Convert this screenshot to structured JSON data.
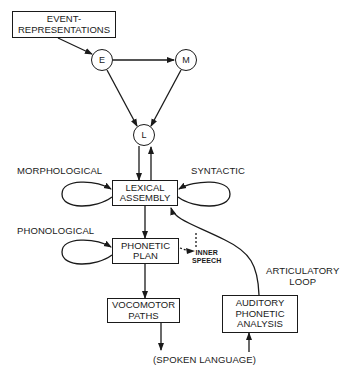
{
  "diagram": {
    "boxes": {
      "event": {
        "line1": "EVENT-",
        "line2": "REPRESENTATIONS"
      },
      "lexical": {
        "line1": "LEXICAL",
        "line2": "ASSEMBLY"
      },
      "phonetic": {
        "line1": "PHONETIC",
        "line2": "PLAN"
      },
      "vocomotor": {
        "line1": "VOCOMOTOR",
        "line2": "PATHS"
      },
      "auditory": {
        "line1": "AUDITORY",
        "line2": "PHONETIC",
        "line3": "ANALYSIS"
      }
    },
    "nodes": {
      "e": "E",
      "m": "M",
      "l": "L"
    },
    "labels": {
      "morphological": "MORPHOLOGICAL",
      "syntactic": "SYNTACTIC",
      "phonological": "PHONOLOGICAL",
      "inner_speech_1": "INNER",
      "inner_speech_2": "SPEECH",
      "articulatory_1": "ARTICULATORY",
      "articulatory_2": "LOOP",
      "spoken_language": "(SPOKEN LANGUAGE)"
    },
    "colors": {
      "line": "#1a1a1a",
      "background": "#ffffff"
    }
  }
}
